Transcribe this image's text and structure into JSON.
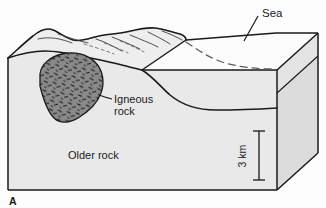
{
  "figure": {
    "panel_label": "A",
    "kind": "geologic-block-diagram",
    "background_color": "#fdfdfd",
    "outline_color": "#1a1a1a"
  },
  "labels": {
    "sea": "Sea",
    "igneous_rock_line1": "Igneous",
    "igneous_rock_line2": "rock",
    "older_rock": "Older rock",
    "scale": "3 km"
  },
  "colors": {
    "rock_face_front": "#e9e9e9",
    "rock_face_side": "#dcdcdc",
    "rock_face_top": "#eeeeee",
    "sea_surface": "#fcfcfc",
    "igneous_fill": "#8a8a8a",
    "igneous_stipple": "#1f1f1f",
    "outline": "#1a1a1a",
    "text": "#1a1a1a"
  },
  "scale_bar": {
    "value": "3 km",
    "orientation": "vertical",
    "text_rotation_deg": -90
  },
  "annotations": [
    {
      "name": "sea-leader-line",
      "from": "Sea label",
      "to": "sea surface"
    },
    {
      "name": "igneous-leader-line",
      "from": "Igneous rock label",
      "to": "igneous body"
    }
  ]
}
